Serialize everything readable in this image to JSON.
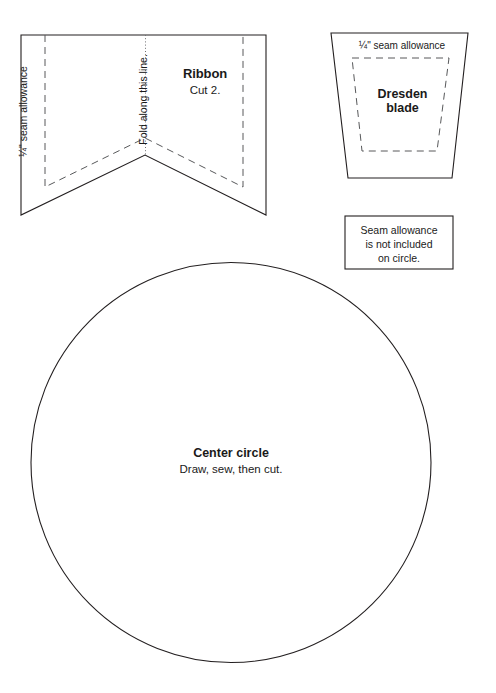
{
  "page": {
    "header_fragment": "",
    "background_color": "#ffffff",
    "ink_color": "#231f20",
    "dash_color": "#58595b",
    "width": 496,
    "height": 693
  },
  "ribbon": {
    "title": "Ribbon",
    "cut_instruction": "Cut 2.",
    "seam_allowance_label": "¼\" seam allowance",
    "fold_label": "Fold along this line."
  },
  "dresden": {
    "seam_allowance_label": "¼\" seam allowance",
    "title_line_1": "Dresden",
    "title_line_2": "blade"
  },
  "note": {
    "line_1": "Seam allowance",
    "line_2": "is not included",
    "line_3": "on circle."
  },
  "circle": {
    "title": "Center circle",
    "subtitle": "Draw, sew, then cut."
  }
}
